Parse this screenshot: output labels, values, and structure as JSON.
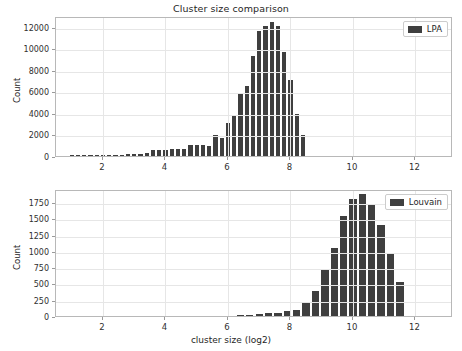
{
  "figure": {
    "title": "Cluster size comparison",
    "xlabel": "cluster size (log2)",
    "bar_color": "#3f3f3f",
    "grid_color": "#e6e6e6"
  },
  "chart_data": [
    {
      "type": "bar",
      "title": "Cluster size comparison",
      "subplot": "top",
      "legend": "LPA",
      "legend_position": "upper right",
      "xlabel": "",
      "ylabel": "Count",
      "xlim": [
        0.5,
        13.2
      ],
      "ylim": [
        0,
        13000
      ],
      "xticks": [
        2,
        4,
        6,
        8,
        10,
        12
      ],
      "yticks": [
        0,
        2000,
        4000,
        6000,
        8000,
        10000,
        12000
      ],
      "grid": true,
      "bin_width": 0.2,
      "x": [
        1.0,
        1.2,
        1.4,
        1.6,
        1.8,
        2.0,
        2.2,
        2.4,
        2.6,
        2.8,
        3.0,
        3.2,
        3.4,
        3.6,
        3.8,
        4.0,
        4.2,
        4.4,
        4.6,
        4.8,
        5.0,
        5.2,
        5.4,
        5.6,
        5.8,
        6.0,
        6.2,
        6.4,
        6.6,
        6.8,
        7.0,
        7.2,
        7.4,
        7.6,
        7.8,
        8.0,
        8.2,
        8.4
      ],
      "values": [
        60,
        30,
        20,
        25,
        30,
        80,
        40,
        120,
        140,
        180,
        200,
        230,
        260,
        560,
        590,
        600,
        620,
        660,
        680,
        980,
        1010,
        1030,
        940,
        1980,
        1700,
        3020,
        3730,
        5880,
        6480,
        9250,
        11580,
        12080,
        12420,
        12060,
        9640,
        7020,
        3870,
        1980,
        830,
        330,
        60
      ]
    },
    {
      "type": "bar",
      "subplot": "bottom",
      "legend": "Louvain",
      "legend_position": "upper right",
      "xlabel": "cluster size (log2)",
      "ylabel": "Count",
      "xlim": [
        0.5,
        13.2
      ],
      "ylim": [
        0,
        1950
      ],
      "xticks": [
        2,
        4,
        6,
        8,
        10,
        12
      ],
      "yticks": [
        0,
        250,
        500,
        750,
        1000,
        1250,
        1500,
        1750
      ],
      "grid": true,
      "bin_width": 0.3,
      "x": [
        6.4,
        6.7,
        7.0,
        7.3,
        7.6,
        7.9,
        8.2,
        8.5,
        8.8,
        9.1,
        9.4,
        9.7,
        10.0,
        10.3,
        10.6,
        10.9,
        11.2,
        11.5
      ],
      "values": [
        10,
        18,
        30,
        42,
        50,
        70,
        100,
        215,
        390,
        700,
        1040,
        1530,
        1790,
        1870,
        1700,
        1390,
        950,
        520,
        245,
        90,
        15
      ]
    }
  ],
  "top": {
    "legend": "LPA",
    "ylabel": "Count",
    "yticks": [
      "12000",
      "10000",
      "8000",
      "6000",
      "4000",
      "2000",
      "0"
    ],
    "xticks": [
      "2",
      "4",
      "6",
      "8",
      "10",
      "12"
    ]
  },
  "bottom": {
    "legend": "Louvain",
    "ylabel": "Count",
    "xlabel": "cluster size (log2)",
    "yticks": [
      "1750",
      "1500",
      "1250",
      "1000",
      "750",
      "500",
      "250",
      "0"
    ],
    "xticks": [
      "2",
      "4",
      "6",
      "8",
      "10",
      "12"
    ]
  }
}
